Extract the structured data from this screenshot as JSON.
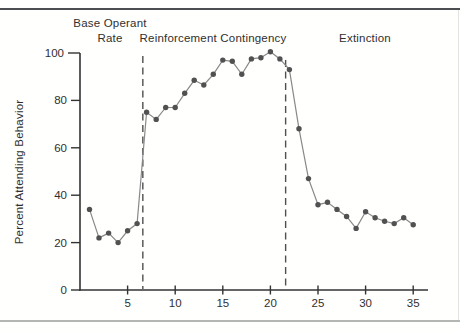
{
  "figure": {
    "ylabel": "Percent Attending Behavior",
    "phase_labels": {
      "base_operant_line1": "Base Operant",
      "base_operant_line2": "Rate",
      "reinforcement": "Reinforcement Contingency",
      "extinction": "Extinction"
    }
  },
  "chart_data": {
    "type": "line",
    "title": "",
    "xlabel": "",
    "ylabel": "Percent Attending Behavior",
    "legend": "none",
    "grid": false,
    "marker": "filled-circle",
    "x": [
      1,
      2,
      3,
      4,
      5,
      6,
      7,
      8,
      9,
      10,
      11,
      12,
      13,
      14,
      15,
      16,
      17,
      18,
      19,
      20,
      21,
      22,
      23,
      24,
      25,
      26,
      27,
      28,
      29,
      30,
      31,
      32,
      33,
      34,
      35
    ],
    "values": [
      34,
      22,
      24,
      20,
      25,
      28,
      75,
      72,
      77,
      77,
      83,
      88.5,
      86.5,
      91,
      97,
      96.5,
      91,
      97.5,
      98,
      100.5,
      97.5,
      93,
      68,
      47,
      36,
      37,
      34,
      31,
      26,
      33,
      30.5,
      29,
      28,
      30.5,
      27.5
    ],
    "xticks": [
      5,
      10,
      15,
      20,
      25,
      30,
      35
    ],
    "yticks": [
      0,
      20,
      40,
      60,
      80,
      100
    ],
    "xlim": [
      0,
      36.5
    ],
    "ylim": [
      0,
      100
    ],
    "phase_boundaries_x": [
      6.6,
      21.6
    ],
    "phases": [
      {
        "label": "Base Operant Rate",
        "x_range": [
          1,
          6
        ]
      },
      {
        "label": "Reinforcement Contingency",
        "x_range": [
          7,
          21
        ]
      },
      {
        "label": "Extinction",
        "x_range": [
          22,
          35
        ]
      }
    ],
    "colors": {
      "line": "#898989",
      "marker": "#515151",
      "axis": "#333333",
      "dashed": "#4f4f4f",
      "text": "#2f2f2f",
      "top_rule": "#4b4d51",
      "bottom_rule": "#b4b6b3"
    }
  }
}
